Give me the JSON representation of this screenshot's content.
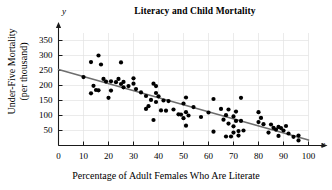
{
  "chart_data": {
    "type": "scatter",
    "title": "Literacy and Child Mortality",
    "xlabel": "Percentage of Adult Females Who Are Literate",
    "ylabel": "Under-Five Mortality (per thousand)",
    "ylabel_line1": "Under-Five Mortality",
    "ylabel_line2": "(per thousand)",
    "x_axis_variable": "x",
    "y_axis_variable": "y",
    "xlim": [
      0,
      100
    ],
    "ylim": [
      0,
      375
    ],
    "xticks": [
      0,
      10,
      20,
      30,
      40,
      50,
      60,
      70,
      80,
      90,
      100
    ],
    "yticks": [
      50,
      100,
      150,
      200,
      250,
      300,
      350
    ],
    "grid": true,
    "legend": "none",
    "marker_color": "#000000",
    "trendline": {
      "label": "least-squares regression line",
      "color": "#6e6e6e",
      "x_start": 0,
      "y_start": 253,
      "x_end": 100,
      "y_end": 18
    },
    "points": [
      [
        10,
        228
      ],
      [
        13,
        278
      ],
      [
        13,
        174
      ],
      [
        14,
        199
      ],
      [
        15,
        185
      ],
      [
        16,
        300
      ],
      [
        16,
        184
      ],
      [
        17,
        270
      ],
      [
        18,
        222
      ],
      [
        19,
        213
      ],
      [
        20,
        159
      ],
      [
        21,
        214
      ],
      [
        21,
        183
      ],
      [
        23,
        211
      ],
      [
        24,
        222
      ],
      [
        25,
        205
      ],
      [
        25,
        277
      ],
      [
        26,
        212
      ],
      [
        26,
        194
      ],
      [
        28,
        198
      ],
      [
        30,
        206
      ],
      [
        30,
        224
      ],
      [
        31,
        188
      ],
      [
        33,
        177
      ],
      [
        35,
        165
      ],
      [
        35,
        122
      ],
      [
        36,
        131
      ],
      [
        37,
        152
      ],
      [
        38,
        85
      ],
      [
        38,
        206
      ],
      [
        39,
        198
      ],
      [
        39,
        175
      ],
      [
        39,
        145
      ],
      [
        40,
        164
      ],
      [
        41,
        117
      ],
      [
        42,
        150
      ],
      [
        43,
        116
      ],
      [
        44,
        148
      ],
      [
        46,
        120
      ],
      [
        48,
        104
      ],
      [
        49,
        103
      ],
      [
        50,
        140
      ],
      [
        50,
        91
      ],
      [
        51,
        160
      ],
      [
        51,
        111
      ],
      [
        51,
        66
      ],
      [
        52,
        100
      ],
      [
        54,
        128
      ],
      [
        57,
        95
      ],
      [
        60,
        110
      ],
      [
        62,
        155
      ],
      [
        62,
        46
      ],
      [
        65,
        122
      ],
      [
        66,
        86
      ],
      [
        67,
        30
      ],
      [
        67,
        101
      ],
      [
        68,
        73
      ],
      [
        68,
        120
      ],
      [
        69,
        30
      ],
      [
        70,
        97
      ],
      [
        70,
        64
      ],
      [
        70,
        43
      ],
      [
        71,
        113
      ],
      [
        71,
        82
      ],
      [
        72,
        48
      ],
      [
        72,
        33
      ],
      [
        73,
        159
      ],
      [
        73,
        82
      ],
      [
        74,
        50
      ],
      [
        80,
        111
      ],
      [
        80,
        78
      ],
      [
        81,
        92
      ],
      [
        82,
        71
      ],
      [
        84,
        43
      ],
      [
        85,
        70
      ],
      [
        86,
        59
      ],
      [
        87,
        53
      ],
      [
        88,
        62
      ],
      [
        88,
        32
      ],
      [
        89,
        58
      ],
      [
        90,
        50
      ],
      [
        91,
        65
      ],
      [
        92,
        40
      ],
      [
        94,
        29
      ],
      [
        96,
        17
      ],
      [
        96,
        33
      ]
    ]
  }
}
